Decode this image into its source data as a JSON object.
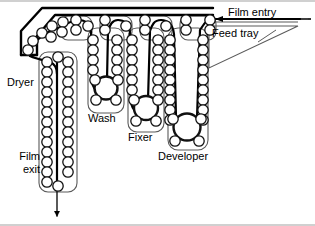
{
  "diagram": {
    "type": "schematic",
    "colors": {
      "ink": "#000000",
      "tank_outline": "#555555",
      "background": "#ffffff",
      "roller_outline": "#1a1a1a"
    },
    "labels": {
      "dryer": "Dryer",
      "wash": "Wash",
      "fixer": "Fixer",
      "developer": "Developer",
      "film_exit": "Film\nexit",
      "film_entry": "Film entry",
      "feed_tray": "Feed tray"
    },
    "flow_order": [
      "Film entry",
      "Feed tray",
      "Developer",
      "Fixer",
      "Wash",
      "Dryer",
      "Film exit"
    ],
    "stations": [
      {
        "name": "Dryer",
        "x": 58,
        "depth": "deepest",
        "roller_columns": 2,
        "rollers_per_column": 13
      },
      {
        "name": "Wash",
        "x": 110,
        "depth": "shallow",
        "roller_columns": 2,
        "rollers_per_column": 5
      },
      {
        "name": "Fixer",
        "x": 148,
        "depth": "medium",
        "roller_columns": 2,
        "rollers_per_column": 7
      },
      {
        "name": "Developer",
        "x": 190,
        "depth": "deep",
        "roller_columns": 2,
        "rollers_per_column": 9
      }
    ],
    "entry_arrow_direction": "left",
    "exit_arrow_direction": "down"
  }
}
